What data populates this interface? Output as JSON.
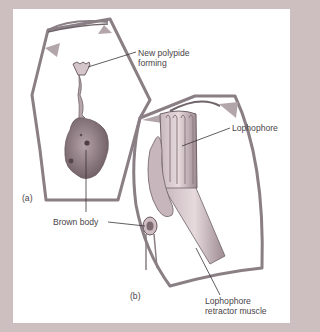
{
  "figure": {
    "colors": {
      "background": "#cdbfbf",
      "panel": "#ffffff",
      "wall": "#8a7f84",
      "tissue": "#b9a8ad",
      "tissue_dark": "#7d6c72",
      "leader": "#3a3438",
      "text": "#4a4448"
    },
    "panels": [
      {
        "id": "a",
        "label": "(a)"
      },
      {
        "id": "b",
        "label": "(b)"
      }
    ],
    "labels": {
      "new_polypide_line1": "New polypide",
      "new_polypide_line2": "forming",
      "lophophore": "Lophophore",
      "brown_body": "Brown body",
      "retractor_line1": "Lophophore",
      "retractor_line2": "retractor muscle"
    }
  }
}
